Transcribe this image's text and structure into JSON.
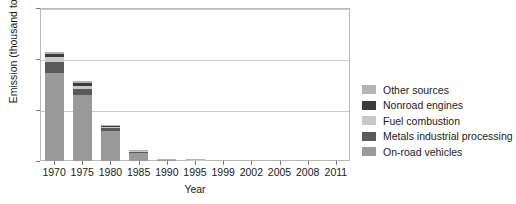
{
  "chart_data": {
    "type": "bar",
    "subtype": "stacked-bar",
    "title": "",
    "xlabel": "Year",
    "ylabel": "Emission (thousand tons)",
    "categories": [
      "1970",
      "1975",
      "1980",
      "1985",
      "1990",
      "1995",
      "1999",
      "2002",
      "2005",
      "2008",
      "2011"
    ],
    "ylim": [
      0,
      300
    ],
    "yticks": [
      "0",
      "100",
      "200",
      "300"
    ],
    "ytick_values": [
      0,
      100,
      200,
      300
    ],
    "grid": "horizontal",
    "legend_position": "right",
    "stack_order_bottom_to_top": [
      "On-road vehicles",
      "Metals industrial processing",
      "Fuel combustion",
      "Nonroad engines",
      "Other sources"
    ],
    "series": [
      {
        "name": "On-road vehicles",
        "color": "#9a9a9a",
        "values": [
          172,
          130,
          59,
          17,
          2.0,
          1.0,
          0.5,
          0.2,
          0.1,
          0.1,
          0.1
        ]
      },
      {
        "name": "Metals industrial processing",
        "color": "#5a5a5a",
        "values": [
          22,
          12,
          6,
          1.5,
          0.6,
          0.4,
          0.3,
          0.2,
          0.2,
          0.1,
          0.1
        ]
      },
      {
        "name": "Fuel combustion",
        "color": "#c8c8c8",
        "values": [
          9,
          5,
          2.5,
          0.8,
          0.4,
          0.3,
          0.2,
          0.1,
          0.1,
          0.1,
          0.1
        ]
      },
      {
        "name": "Nonroad engines",
        "color": "#3c3c3c",
        "values": [
          6,
          6,
          2.5,
          0.5,
          0.3,
          0.2,
          0.2,
          0.1,
          0.1,
          0.1,
          0.1
        ]
      },
      {
        "name": "Other sources",
        "color": "#b4b4b4",
        "values": [
          4,
          4,
          1.0,
          0.4,
          0.2,
          0.2,
          0.1,
          0.1,
          0.1,
          0.1,
          0.1
        ]
      }
    ],
    "totals": [
      213,
      157,
      71,
      20.2,
      3.5,
      2.1,
      1.3,
      0.7,
      0.6,
      0.5,
      0.5
    ]
  },
  "legend": {
    "items": [
      {
        "label": "Other sources",
        "color": "#b4b4b4"
      },
      {
        "label": "Nonroad engines",
        "color": "#3c3c3c"
      },
      {
        "label": "Fuel combustion",
        "color": "#c8c8c8"
      },
      {
        "label": "Metals industrial processing",
        "color": "#5a5a5a"
      },
      {
        "label": "On-road vehicles",
        "color": "#9a9a9a"
      }
    ]
  },
  "axes": {
    "frame_color": "#b9b9b9",
    "grid_color": "#c9c9c9",
    "text_color": "#1a1a1a"
  }
}
